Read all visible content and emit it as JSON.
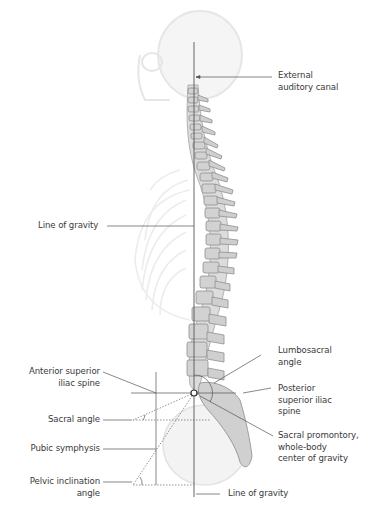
{
  "figure": {
    "type": "anatomical-diagram",
    "colors": {
      "line": "#555555",
      "bone": "#c9c9c9",
      "bone_dark": "#8a8a8a",
      "ghost": "#e4e4e4",
      "text": "#3a3a3a"
    }
  },
  "labels": {
    "external_auditory_canal": "External\nauditory canal",
    "line_of_gravity_left": "Line of gravity",
    "lumbosacral_angle": "Lumbosacral\nangle",
    "anterior_superior_iliac_spine": "Anterior superior\niliac spine",
    "posterior_superior_iliac_spine": "Posterior\nsuperior iliac\nspine",
    "sacral_angle": "Sacral angle",
    "sacral_promontory": "Sacral promontory,\nwhole-body\ncenter of gravity",
    "pubic_symphysis": "Pubic symphysis",
    "pelvic_inclination_angle": "Pelvic inclination\nangle",
    "line_of_gravity_bottom": "Line of gravity"
  }
}
